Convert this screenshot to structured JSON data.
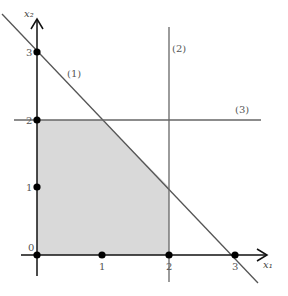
{
  "diagram": {
    "type": "linear-programming-feasible-region",
    "axes": {
      "x_label": "x₁",
      "y_label": "x₂",
      "x_ticks": [
        "0",
        "1",
        "2",
        "3"
      ],
      "y_ticks": [
        "1",
        "2",
        "3"
      ],
      "origin_label": "0"
    },
    "constraints": [
      {
        "label": "(1)",
        "description": "x1 + x2 = 3"
      },
      {
        "label": "(2)",
        "description": "x1 = 2"
      },
      {
        "label": "(3)",
        "description": "x2 = 2"
      }
    ],
    "feasible_region_vertices": [
      [
        0,
        0
      ],
      [
        2,
        0
      ],
      [
        2,
        1
      ],
      [
        1,
        2
      ],
      [
        0,
        2
      ]
    ],
    "marked_points": [
      [
        0,
        0
      ],
      [
        1,
        0
      ],
      [
        2,
        0
      ],
      [
        3,
        0
      ],
      [
        0,
        1
      ],
      [
        0,
        2
      ],
      [
        0,
        3
      ]
    ],
    "colors": {
      "region_fill": "#d9d9d9",
      "lines": "#555555",
      "axes": "#111111"
    }
  }
}
